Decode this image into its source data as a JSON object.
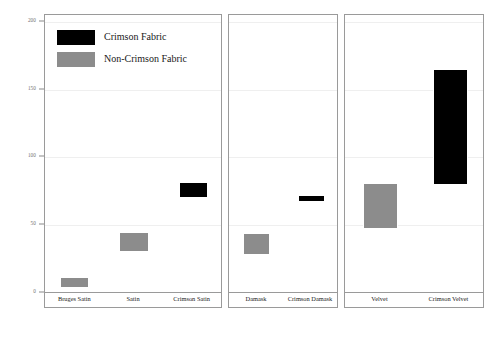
{
  "chart_data": {
    "type": "bar",
    "title": "",
    "subtitle": "",
    "xlabel": "",
    "ylabel": "",
    "ylim": [
      0,
      205
    ],
    "grid": true,
    "yticks": [
      0,
      50,
      100,
      150,
      200
    ],
    "ytick_labels": [
      "0",
      "50",
      "100",
      "150",
      "200"
    ],
    "orientation": "vertical",
    "bar_style": "floating-range",
    "legend": {
      "position": "top-left",
      "entries": [
        {
          "label": "Crimson Fabric",
          "color": "#000000",
          "key": "crimson"
        },
        {
          "label": "Non-Crimson Fabric",
          "color": "#8c8c8c",
          "key": "noncrimson"
        }
      ]
    },
    "panels": [
      {
        "name": "satin-panel",
        "categories": [
          "Bruges Satin",
          "Satin",
          "Crimson Satin"
        ],
        "bars": [
          {
            "category": "Bruges Satin",
            "low": 4,
            "high": 12,
            "series": "Non-Crimson Fabric",
            "color": "#8c8c8c"
          },
          {
            "category": "Satin",
            "low": 30,
            "high": 45,
            "series": "Non-Crimson Fabric",
            "color": "#8c8c8c"
          },
          {
            "category": "Crimson Satin",
            "low": 70,
            "high": 82,
            "series": "Crimson Fabric",
            "color": "#000000"
          }
        ]
      },
      {
        "name": "damask-panel",
        "categories": [
          "Damask",
          "Crimson Damask"
        ],
        "bars": [
          {
            "category": "Damask",
            "low": 28,
            "high": 44,
            "series": "Non-Crimson Fabric",
            "color": "#8c8c8c"
          },
          {
            "category": "Crimson Damask",
            "low": 67,
            "high": 72,
            "series": "Crimson Fabric",
            "color": "#000000"
          }
        ]
      },
      {
        "name": "velvet-panel",
        "categories": [
          "Velvet",
          "Crimson Velvet"
        ],
        "bars": [
          {
            "category": "Velvet",
            "low": 47,
            "high": 81,
            "series": "Non-Crimson Fabric",
            "color": "#8c8c8c"
          },
          {
            "category": "Crimson Velvet",
            "low": 80,
            "high": 165,
            "series": "Crimson Fabric",
            "color": "#000000"
          }
        ]
      }
    ]
  },
  "layout": {
    "panel_geometry": [
      {
        "left": 44,
        "width": 178
      },
      {
        "left": 228,
        "width": 110
      },
      {
        "left": 344,
        "width": 140
      }
    ],
    "plot_top_px": 14,
    "plot_bottom_px": 292,
    "y_zero_px": 292,
    "y_max_value": 205
  }
}
